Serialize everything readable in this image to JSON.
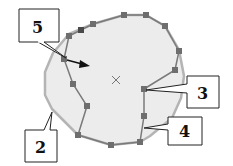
{
  "diagram": {
    "type": "polygon-editing-illustration",
    "colors": {
      "background": "#ffffff",
      "region_fill": "#ececec",
      "region_outline": "#b4b4b4",
      "edit_line": "#7a7a7a",
      "node_fill": "#6e6e6e",
      "node_dark": "#4a4a4a",
      "callout_border": "#222222",
      "callout_fill": "#ffffff",
      "arrow": "#111111",
      "center_mark": "#777777"
    },
    "callouts": [
      {
        "id": "5",
        "label": "5"
      },
      {
        "id": "2",
        "label": "2"
      },
      {
        "id": "3",
        "label": "3"
      },
      {
        "id": "4",
        "label": "4"
      }
    ],
    "center_mark": {
      "glyph": "×"
    }
  }
}
